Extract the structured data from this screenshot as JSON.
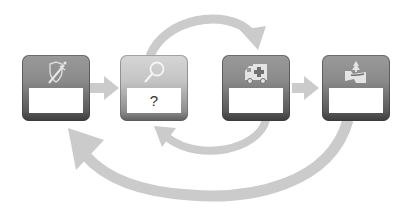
{
  "diagram": {
    "type": "process-cycle",
    "steps": [
      {
        "id": "step-1",
        "icon": "shield-sword-icon",
        "label": "",
        "active": false
      },
      {
        "id": "step-2",
        "icon": "magnifier-icon",
        "label": "?",
        "active": true
      },
      {
        "id": "step-3",
        "icon": "ambulance-icon",
        "label": "",
        "active": false
      },
      {
        "id": "step-4",
        "icon": "road-recovery-icon",
        "label": "",
        "active": false
      }
    ],
    "connectors": [
      {
        "from": "step-1",
        "to": "step-2",
        "shape": "straight-arrow"
      },
      {
        "from": "step-2",
        "to": "step-3",
        "shape": "top-arc-arrow"
      },
      {
        "from": "step-3",
        "to": "step-4",
        "shape": "straight-arrow"
      },
      {
        "from": "step-3",
        "to": "step-2",
        "shape": "bottom-arc-arrow"
      },
      {
        "from": "step-4",
        "to": "step-1",
        "shape": "large-bottom-arc-arrow"
      }
    ],
    "colors": {
      "arrow": "#c8c8c8",
      "box_dark": "#7a7a7a",
      "box_active": "#c4c4c4",
      "label_bg": "#ffffff"
    }
  }
}
